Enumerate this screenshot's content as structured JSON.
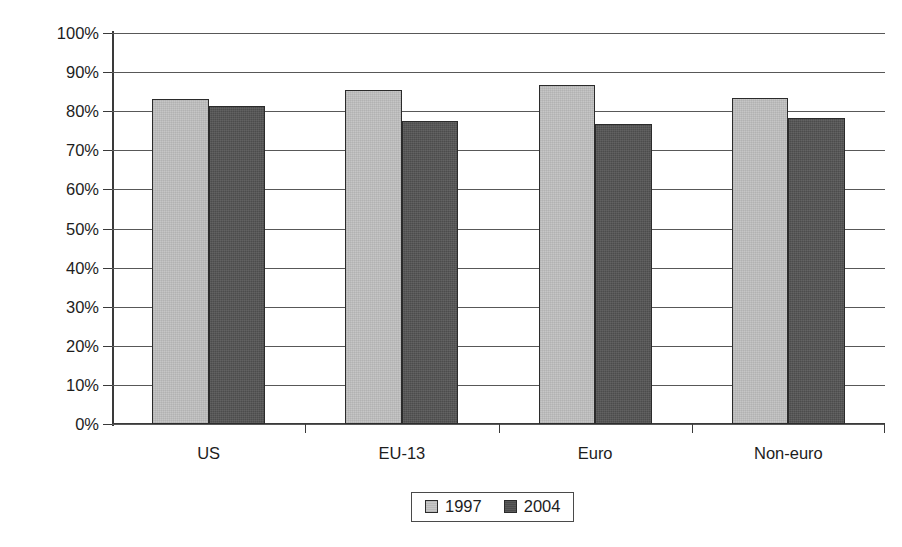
{
  "chart_data": {
    "type": "bar",
    "title": "",
    "subtitle": "",
    "xlabel": "",
    "ylabel": "Equity home bias in %",
    "categories": [
      "US",
      "EU-13",
      "Euro",
      "Non-euro"
    ],
    "series": [
      {
        "name": "1997",
        "color": "#c6c6c6",
        "values": [
          83.0,
          85.5,
          86.7,
          83.5
        ]
      },
      {
        "name": "2004",
        "color": "#4c4c4c",
        "values": [
          81.3,
          77.5,
          76.7,
          78.2
        ]
      }
    ],
    "ylim": [
      0,
      100
    ],
    "ytick_values": [
      0,
      10,
      20,
      30,
      40,
      50,
      60,
      70,
      80,
      90,
      100
    ],
    "ytick_labels": [
      "0%",
      "10%",
      "20%",
      "30%",
      "40%",
      "50%",
      "60%",
      "70%",
      "80%",
      "90%",
      "100%"
    ],
    "grid": "horizontal",
    "legend_position": "bottom-center",
    "legend_entries": [
      "1997",
      "2004"
    ],
    "annotations": []
  },
  "axis": {
    "y_title": "Equity home bias in %"
  },
  "legend": {
    "items": [
      {
        "label": "1997"
      },
      {
        "label": "2004"
      }
    ]
  }
}
